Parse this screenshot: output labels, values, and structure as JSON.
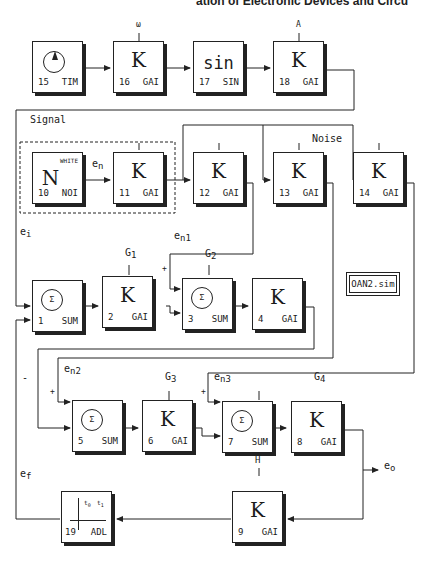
{
  "header": {
    "title": "ation of Electronic Devices and Circu"
  },
  "file_label": "OAN2.sim",
  "region_labels": {
    "signal": "Signal",
    "noise": "Noise"
  },
  "blocks": {
    "b15": {
      "num": "15",
      "type": "TIM",
      "symbol": "clock-icon"
    },
    "b16": {
      "num": "16",
      "type": "GAI",
      "symbol": "K",
      "param": "ω"
    },
    "b17": {
      "num": "17",
      "type": "SIN",
      "symbol": "sin"
    },
    "b18": {
      "num": "18",
      "type": "GAI",
      "symbol": "K",
      "param": "A"
    },
    "b10": {
      "num": "10",
      "type": "NOI",
      "symbol": "N",
      "tag": "WHITE"
    },
    "b11": {
      "num": "11",
      "type": "GAI",
      "symbol": "K"
    },
    "b12": {
      "num": "12",
      "type": "GAI",
      "symbol": "K"
    },
    "b13": {
      "num": "13",
      "type": "GAI",
      "symbol": "K"
    },
    "b14": {
      "num": "14",
      "type": "GAI",
      "symbol": "K"
    },
    "b1": {
      "num": "1",
      "type": "SUM",
      "symbol": "Σ"
    },
    "b2": {
      "num": "2",
      "type": "GAI",
      "symbol": "K",
      "param": "G",
      "param_sub": "1"
    },
    "b3": {
      "num": "3",
      "type": "SUM",
      "symbol": "Σ"
    },
    "b4": {
      "num": "4",
      "type": "GAI",
      "symbol": "K",
      "param": "G",
      "param_sub": "2"
    },
    "b5": {
      "num": "5",
      "type": "SUM",
      "symbol": "Σ"
    },
    "b6": {
      "num": "6",
      "type": "GAI",
      "symbol": "K",
      "param": "G",
      "param_sub": "3"
    },
    "b7": {
      "num": "7",
      "type": "SUM",
      "symbol": "Σ"
    },
    "b8": {
      "num": "8",
      "type": "GAI",
      "symbol": "K",
      "param": "G",
      "param_sub": "4"
    },
    "b9": {
      "num": "9",
      "type": "GAI",
      "symbol": "K",
      "param": "H"
    },
    "b19": {
      "num": "19",
      "type": "ADL",
      "t0": "t",
      "t0_sub": "0",
      "t1": "t",
      "t1_sub": "1"
    }
  },
  "signals": {
    "en": {
      "base": "e",
      "sub": "n"
    },
    "ei": {
      "base": "e",
      "sub": "i"
    },
    "en1": {
      "base": "e",
      "sub": "n1"
    },
    "en2": {
      "base": "e",
      "sub": "n2"
    },
    "en3": {
      "base": "e",
      "sub": "n3"
    },
    "ef": {
      "base": "e",
      "sub": "f"
    },
    "eo": {
      "base": "e",
      "sub": "o"
    }
  },
  "signs": {
    "plus": "+",
    "minus": "-"
  }
}
